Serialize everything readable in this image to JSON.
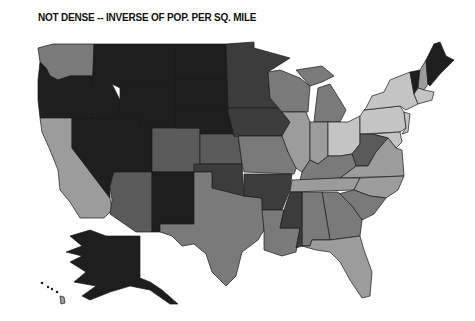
{
  "title": "NOT DENSE -- INVERSE OF POP. PER SQ. MILE",
  "map": {
    "type": "choropleth",
    "region": "United States",
    "legend": null,
    "shades": {
      "level1_darkest": "#1e1e1e",
      "level2_dark": "#3c3c3c",
      "level3_mid_dark": "#5a5a5a",
      "level4_mid": "#7a7a7a",
      "level5_light": "#9c9c9c",
      "level6_lightest": "#c4c4c4"
    },
    "states": [
      {
        "name": "Washington",
        "shade": "level4_mid"
      },
      {
        "name": "Oregon",
        "shade": "level1_darkest"
      },
      {
        "name": "California",
        "shade": "level5_light"
      },
      {
        "name": "Idaho",
        "shade": "level1_darkest"
      },
      {
        "name": "Nevada",
        "shade": "level1_darkest"
      },
      {
        "name": "Montana",
        "shade": "level1_darkest"
      },
      {
        "name": "Wyoming",
        "shade": "level1_darkest"
      },
      {
        "name": "Utah",
        "shade": "level1_darkest"
      },
      {
        "name": "Arizona",
        "shade": "level3_mid_dark"
      },
      {
        "name": "Colorado",
        "shade": "level3_mid_dark"
      },
      {
        "name": "New Mexico",
        "shade": "level1_darkest"
      },
      {
        "name": "North Dakota",
        "shade": "level1_darkest"
      },
      {
        "name": "South Dakota",
        "shade": "level1_darkest"
      },
      {
        "name": "Nebraska",
        "shade": "level1_darkest"
      },
      {
        "name": "Kansas",
        "shade": "level3_mid_dark"
      },
      {
        "name": "Oklahoma",
        "shade": "level2_dark"
      },
      {
        "name": "Texas",
        "shade": "level4_mid"
      },
      {
        "name": "Minnesota",
        "shade": "level2_dark"
      },
      {
        "name": "Iowa",
        "shade": "level2_dark"
      },
      {
        "name": "Missouri",
        "shade": "level4_mid"
      },
      {
        "name": "Arkansas",
        "shade": "level2_dark"
      },
      {
        "name": "Louisiana",
        "shade": "level4_mid"
      },
      {
        "name": "Wisconsin",
        "shade": "level4_mid"
      },
      {
        "name": "Illinois",
        "shade": "level5_light"
      },
      {
        "name": "Michigan",
        "shade": "level4_mid"
      },
      {
        "name": "Indiana",
        "shade": "level5_light"
      },
      {
        "name": "Ohio",
        "shade": "level6_lightest"
      },
      {
        "name": "Kentucky",
        "shade": "level4_mid"
      },
      {
        "name": "Tennessee",
        "shade": "level5_light"
      },
      {
        "name": "Mississippi",
        "shade": "level2_dark"
      },
      {
        "name": "Alabama",
        "shade": "level4_mid"
      },
      {
        "name": "Georgia",
        "shade": "level4_mid"
      },
      {
        "name": "Florida",
        "shade": "level5_light"
      },
      {
        "name": "South Carolina",
        "shade": "level4_mid"
      },
      {
        "name": "North Carolina",
        "shade": "level5_light"
      },
      {
        "name": "Virginia",
        "shade": "level5_light"
      },
      {
        "name": "West Virginia",
        "shade": "level3_mid_dark"
      },
      {
        "name": "Pennsylvania",
        "shade": "level6_lightest"
      },
      {
        "name": "New York",
        "shade": "level6_lightest"
      },
      {
        "name": "Vermont",
        "shade": "level1_darkest"
      },
      {
        "name": "New Hampshire",
        "shade": "level5_light"
      },
      {
        "name": "Maine",
        "shade": "level1_darkest"
      },
      {
        "name": "Massachusetts",
        "shade": "level6_lightest"
      },
      {
        "name": "New Jersey",
        "shade": "level6_lightest"
      },
      {
        "name": "Maryland",
        "shade": "level6_lightest"
      },
      {
        "name": "Alaska",
        "shade": "level1_darkest"
      },
      {
        "name": "Hawaii",
        "shade": "level5_light"
      }
    ]
  }
}
